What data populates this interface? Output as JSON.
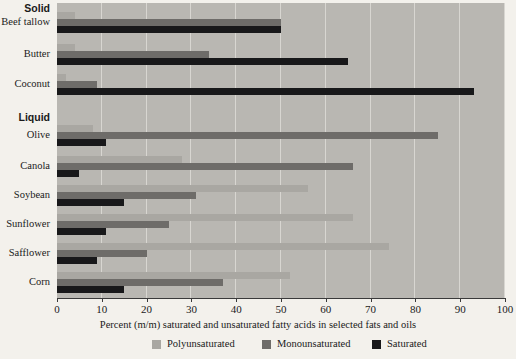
{
  "chart_data": {
    "type": "bar",
    "orientation": "horizontal",
    "title": "",
    "xlabel": "Percent (m/m) saturated and unsaturated fatty acids in selected fats and oils",
    "ylabel": "",
    "xlim": [
      0,
      100
    ],
    "xticks": [
      0,
      10,
      20,
      30,
      40,
      50,
      60,
      70,
      80,
      90,
      100
    ],
    "xtick_labels": [
      "0",
      "10",
      "20",
      "30",
      "40",
      "50",
      "60",
      "70",
      "80",
      "90",
      "100"
    ],
    "grid": "vertical",
    "legend_position": "bottom",
    "group_headings": [
      "Solid",
      "Liquid"
    ],
    "categories": [
      "Beef tallow",
      "Butter",
      "Coconut",
      "Olive",
      "Canola",
      "Soybean",
      "Sunflower",
      "Safflower",
      "Corn"
    ],
    "series": [
      {
        "name": "Polyunsaturated",
        "color": "#a9a7a2",
        "values": [
          4,
          4,
          2,
          8,
          28,
          56,
          66,
          74,
          52
        ]
      },
      {
        "name": "Monounsaturated",
        "color": "#6e6c69",
        "values": [
          50,
          34,
          9,
          85,
          66,
          31,
          25,
          20,
          37
        ]
      },
      {
        "name": "Saturated",
        "color": "#18181a",
        "values": [
          50,
          65,
          93,
          11,
          5,
          15,
          11,
          9,
          15
        ]
      }
    ]
  },
  "axis": {
    "title": "Percent (m/m) saturated and unsaturated fatty acids in selected fats and oils"
  },
  "legend": {
    "entries": [
      {
        "label": "Polyunsaturated",
        "color": "#a9a7a2"
      },
      {
        "label": "Monounsaturated",
        "color": "#6e6c69"
      },
      {
        "label": "Saturated",
        "color": "#18181a"
      }
    ]
  },
  "headings": {
    "solid": "Solid",
    "liquid": "Liquid"
  }
}
